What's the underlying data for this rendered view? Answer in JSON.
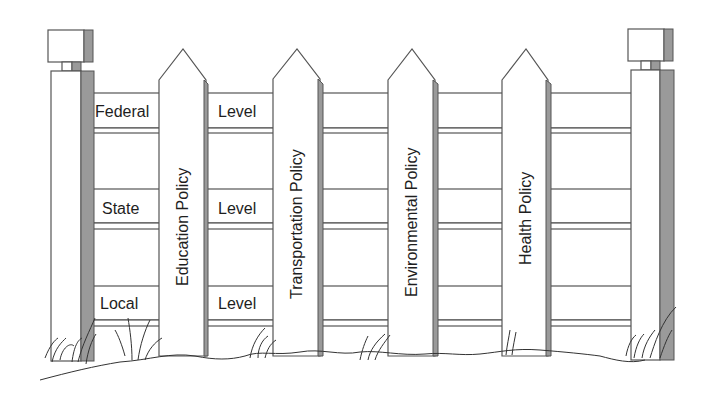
{
  "diagram": {
    "type": "fence-metaphor",
    "rails": [
      {
        "label_left": "Federal",
        "label_mid": "Level"
      },
      {
        "label_left": "State",
        "label_mid": "Level"
      },
      {
        "label_left": "Local",
        "label_mid": "Level"
      }
    ],
    "pickets": [
      {
        "label": "Education Policy"
      },
      {
        "label": "Transportation Policy"
      },
      {
        "label": "Environmental Policy"
      },
      {
        "label": "Health Policy"
      }
    ],
    "colors": {
      "line": "#555555",
      "shadow": "#9a9a9a",
      "text": "#1e1e1e",
      "background": "#ffffff"
    }
  }
}
